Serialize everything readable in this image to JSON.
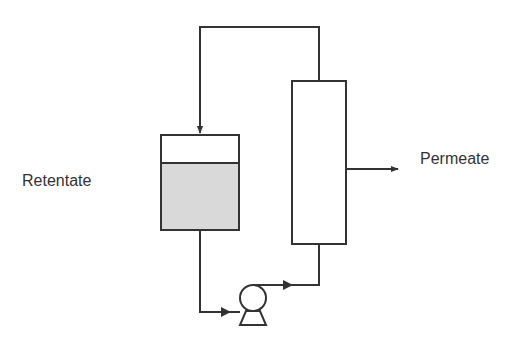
{
  "diagram": {
    "title": "",
    "labels": {
      "retentate": "Retentate",
      "permeate": "Permeate"
    },
    "components": [
      {
        "id": "retentate-tank",
        "type": "tank",
        "fill_color": "#d9d9d9"
      },
      {
        "id": "membrane-module",
        "type": "column"
      },
      {
        "id": "pump",
        "type": "pump"
      }
    ],
    "colors": {
      "stroke": "#333333",
      "liquid": "#d9d9d9",
      "background": "#ffffff"
    }
  }
}
